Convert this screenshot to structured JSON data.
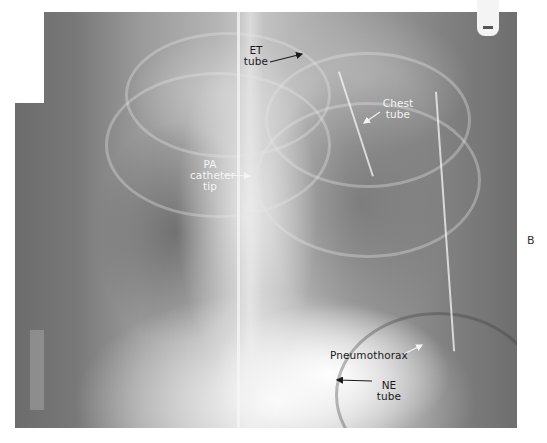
{
  "figure": {
    "panel_label": "B",
    "image_description": "Chest X-ray (AP view) showing support devices"
  },
  "annotations": [
    {
      "id": "et-tube",
      "lines": [
        "ET",
        "tube"
      ],
      "text_color": "dark"
    },
    {
      "id": "chest-tube",
      "lines": [
        "Chest",
        "tube"
      ],
      "text_color": "light"
    },
    {
      "id": "pa-catheter-tip",
      "lines": [
        "PA",
        "catheter",
        "tip"
      ],
      "text_color": "light"
    },
    {
      "id": "pneumothorax",
      "lines": [
        "Pneumothorax"
      ],
      "text_color": "dark"
    },
    {
      "id": "ne-tube",
      "lines": [
        "NE",
        "tube"
      ],
      "text_color": "dark"
    }
  ],
  "colors": {
    "background": "#ffffff",
    "dark_label": "#1a1a1a",
    "light_label": "#f4f4f4"
  }
}
